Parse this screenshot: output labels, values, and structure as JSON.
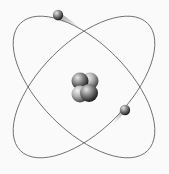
{
  "diagram": {
    "type": "bohr-atom-model",
    "label": "",
    "colors": {
      "background": "#fafafa",
      "orbit": "#6a6a6a",
      "particle_light": "#d8d8d8",
      "particle_dark": "#2a2a2a"
    },
    "nucleus": {
      "particle_count": 4
    },
    "orbits": [
      {
        "name": "orbit-1",
        "rotation_deg": 45
      },
      {
        "name": "orbit-2",
        "rotation_deg": -45
      }
    ],
    "electrons": [
      {
        "name": "electron-top-left"
      },
      {
        "name": "electron-bottom-right"
      }
    ]
  }
}
